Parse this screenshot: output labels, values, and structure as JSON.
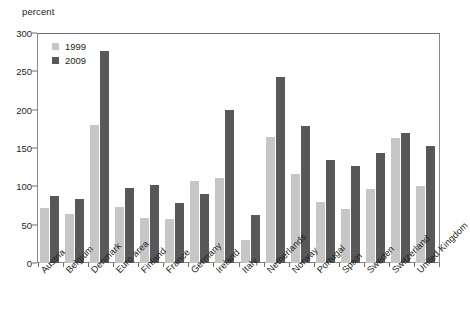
{
  "chart_data": {
    "type": "bar",
    "title": "",
    "subtitle": "",
    "xlabel": "",
    "ylabel": "percent",
    "ylim": [
      0,
      300
    ],
    "yticks": [
      0,
      50,
      100,
      150,
      200,
      250,
      300
    ],
    "ytick_labels": [
      "0",
      "50",
      "100",
      "150",
      "200",
      "250",
      "300"
    ],
    "grid": false,
    "legend_position": "top-left",
    "categories": [
      "Austria",
      "Belgium",
      "Denmark",
      "Euro area",
      "Finland",
      "France",
      "Germany",
      "Ireland",
      "Italy",
      "Netherlands",
      "Norway",
      "Portugal",
      "Spain",
      "Sweden",
      "Switzerland",
      "United Kingdom"
    ],
    "series": [
      {
        "name": "1999",
        "color": "#c6c6c6",
        "values": [
          72,
          64,
          180,
          73,
          59,
          57,
          107,
          111,
          30,
          165,
          116,
          79,
          71,
          96,
          163,
          100
        ]
      },
      {
        "name": "2009",
        "color": "#58585a",
        "values": [
          87,
          83,
          277,
          98,
          102,
          78,
          90,
          200,
          63,
          243,
          179,
          134,
          127,
          143,
          170,
          152
        ]
      }
    ]
  },
  "axis": {
    "unit_label": "percent"
  },
  "legend": {
    "items": [
      {
        "label": "1999",
        "color": "#c6c6c6"
      },
      {
        "label": "2009",
        "color": "#58585a"
      }
    ]
  }
}
